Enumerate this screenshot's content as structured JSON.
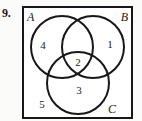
{
  "figure": {
    "problem_number": "9.",
    "universe": {
      "name": "universal-set-rectangle"
    },
    "sets": [
      {
        "id": "A",
        "label": "A",
        "position": "top-left"
      },
      {
        "id": "B",
        "label": "B",
        "position": "top-right"
      },
      {
        "id": "C",
        "label": "C",
        "position": "bottom-right"
      }
    ],
    "regions": [
      {
        "id": "region-a-only",
        "label": "4",
        "description": "A only"
      },
      {
        "id": "region-b-only",
        "label": "1",
        "description": "B only"
      },
      {
        "id": "region-abc",
        "label": "2",
        "description": "A and B and C"
      },
      {
        "id": "region-c-only",
        "label": "3",
        "description": "C only"
      },
      {
        "id": "region-outside",
        "label": "5",
        "description": "outside all circles"
      }
    ]
  },
  "colors": {
    "ink": "#17171a",
    "paper": "#ffffff",
    "page": "#fbfbfa"
  }
}
